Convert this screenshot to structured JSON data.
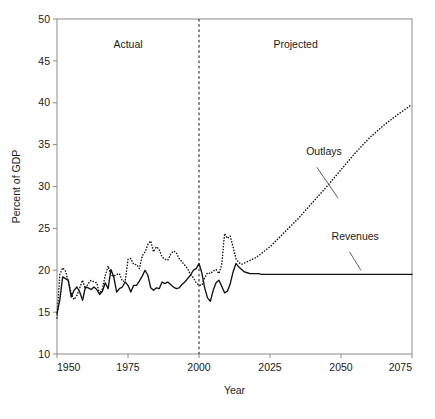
{
  "chart_data": {
    "type": "line",
    "title": "",
    "xlabel": "Year",
    "ylabel": "Percent of GDP",
    "xlim": [
      1950,
      2075
    ],
    "ylim": [
      10,
      50
    ],
    "xticks": [
      1950,
      1975,
      2000,
      2025,
      2050,
      2075
    ],
    "yticks": [
      10,
      15,
      20,
      25,
      30,
      35,
      40,
      45,
      50
    ],
    "grid": false,
    "legend_position": "inline-annotations",
    "annotations": [
      {
        "text": "Actual",
        "x": 1975,
        "y": 46.5
      },
      {
        "text": "Projected",
        "x": 2034,
        "y": 46.5
      },
      {
        "text": "Outlays",
        "x": 2044,
        "y": 33.8
      },
      {
        "text": "Revenues",
        "x": 2055,
        "y": 23.6
      }
    ],
    "divider": {
      "x": 2000,
      "style": "dashed",
      "label_left": "Actual",
      "label_right": "Projected"
    },
    "series": [
      {
        "name": "Revenues",
        "style": "solid",
        "color": "#111111",
        "x": [
          1950,
          1951,
          1952,
          1953,
          1954,
          1955,
          1956,
          1957,
          1958,
          1959,
          1960,
          1961,
          1962,
          1963,
          1964,
          1965,
          1966,
          1967,
          1968,
          1969,
          1970,
          1971,
          1972,
          1973,
          1974,
          1975,
          1976,
          1977,
          1978,
          1979,
          1980,
          1981,
          1982,
          1983,
          1984,
          1985,
          1986,
          1987,
          1988,
          1989,
          1990,
          1991,
          1992,
          1993,
          1994,
          1995,
          1996,
          1997,
          1998,
          1999,
          2000,
          2001,
          2002,
          2003,
          2004,
          2005,
          2006,
          2007,
          2008,
          2009,
          2010,
          2011,
          2012,
          2013,
          2014,
          2015,
          2016,
          2017,
          2018,
          2019,
          2020,
          2021,
          2022,
          2023,
          2030,
          2040,
          2050,
          2060,
          2070,
          2075
        ],
        "values": [
          14.8,
          16.5,
          19.2,
          19.0,
          18.8,
          16.8,
          17.6,
          18.0,
          17.4,
          16.4,
          18.0,
          17.9,
          17.7,
          18.0,
          17.7,
          17.1,
          17.5,
          18.5,
          17.8,
          20.1,
          19.2,
          17.4,
          17.8,
          18.0,
          18.6,
          18.2,
          17.4,
          18.2,
          18.2,
          18.7,
          19.3,
          20.0,
          19.4,
          17.9,
          17.6,
          17.9,
          17.8,
          18.6,
          18.4,
          18.6,
          18.3,
          18.0,
          17.8,
          17.9,
          18.3,
          18.6,
          19.0,
          19.4,
          20.0,
          20.2,
          20.8,
          19.7,
          17.9,
          16.7,
          16.3,
          17.6,
          18.5,
          18.8,
          18.1,
          17.3,
          17.5,
          18.4,
          19.8,
          20.8,
          20.4,
          20.1,
          19.8,
          19.7,
          19.6,
          19.6,
          19.6,
          19.6,
          19.5,
          19.5,
          19.5,
          19.5,
          19.5,
          19.5,
          19.5,
          19.5
        ]
      },
      {
        "name": "Outlays",
        "style": "dotted",
        "color": "#111111",
        "x": [
          1950,
          1951,
          1952,
          1953,
          1954,
          1955,
          1956,
          1957,
          1958,
          1959,
          1960,
          1961,
          1962,
          1963,
          1964,
          1965,
          1966,
          1967,
          1968,
          1969,
          1970,
          1971,
          1972,
          1973,
          1974,
          1975,
          1976,
          1977,
          1978,
          1979,
          1980,
          1981,
          1982,
          1983,
          1984,
          1985,
          1986,
          1987,
          1988,
          1989,
          1990,
          1991,
          1992,
          1993,
          1994,
          1995,
          1996,
          1997,
          1998,
          1999,
          2000,
          2001,
          2002,
          2003,
          2004,
          2005,
          2006,
          2007,
          2008,
          2009,
          2010,
          2011,
          2012,
          2013,
          2014,
          2015,
          2020,
          2025,
          2030,
          2035,
          2040,
          2045,
          2050,
          2055,
          2060,
          2065,
          2070,
          2075
        ],
        "values": [
          14.3,
          19.5,
          20.3,
          19.9,
          18.6,
          17.3,
          16.5,
          17.0,
          17.9,
          18.8,
          17.8,
          18.4,
          18.8,
          18.6,
          18.5,
          17.2,
          17.8,
          19.4,
          20.5,
          19.4,
          19.3,
          19.5,
          19.6,
          18.7,
          18.7,
          21.3,
          21.4,
          20.7,
          20.7,
          20.2,
          21.7,
          22.2,
          23.1,
          23.5,
          22.2,
          22.8,
          22.5,
          21.6,
          21.3,
          21.2,
          21.9,
          22.3,
          22.1,
          21.4,
          21.0,
          20.6,
          20.2,
          19.5,
          19.1,
          18.5,
          18.2,
          18.2,
          19.1,
          19.7,
          19.6,
          19.9,
          20.1,
          19.6,
          20.7,
          24.4,
          23.8,
          24.1,
          22.8,
          21.4,
          20.9,
          20.7,
          21.5,
          22.8,
          24.5,
          26.2,
          28.1,
          30.0,
          32.0,
          34.0,
          35.8,
          37.3,
          38.6,
          39.8
        ]
      }
    ]
  }
}
